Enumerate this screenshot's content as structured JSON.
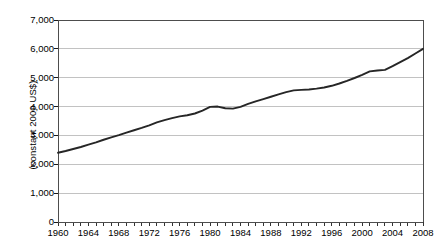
{
  "chart_data": {
    "type": "line",
    "title": "",
    "xlabel": "",
    "ylabel": "(constant 2000 US$)",
    "xlim": [
      1960,
      2008
    ],
    "ylim": [
      0,
      7000
    ],
    "grid": true,
    "legend": "none",
    "y_ticks": [
      0,
      1000,
      2000,
      3000,
      4000,
      5000,
      6000,
      7000
    ],
    "y_tick_labels": [
      "0",
      "1,000",
      "2,000",
      "3,000",
      "4,000",
      "5,000",
      "6,000",
      "7,000"
    ],
    "x_tick_labels": [
      "1960",
      "1964",
      "1968",
      "1972",
      "1976",
      "1980",
      "1984",
      "1988",
      "1992",
      "1996",
      "2000",
      "2004",
      "2008"
    ],
    "x_tick_interval_minor": 1,
    "x_tick_interval_major": 4,
    "series": [
      {
        "name": "GDP per capita",
        "color": "#262626",
        "x": [
          1960,
          1961,
          1962,
          1963,
          1964,
          1965,
          1966,
          1967,
          1968,
          1969,
          1970,
          1971,
          1972,
          1973,
          1974,
          1975,
          1976,
          1977,
          1978,
          1979,
          1980,
          1981,
          1982,
          1983,
          1984,
          1985,
          1986,
          1987,
          1988,
          1989,
          1990,
          1991,
          1992,
          1993,
          1994,
          1995,
          1996,
          1997,
          1998,
          1999,
          2000,
          2001,
          2002,
          2003,
          2004,
          2005,
          2006,
          2007,
          2008
        ],
        "values": [
          2400,
          2460,
          2530,
          2600,
          2680,
          2760,
          2850,
          2930,
          3010,
          3100,
          3180,
          3260,
          3350,
          3450,
          3530,
          3600,
          3660,
          3700,
          3760,
          3860,
          3990,
          4000,
          3940,
          3930,
          3990,
          4090,
          4180,
          4260,
          4340,
          4420,
          4500,
          4560,
          4580,
          4590,
          4620,
          4660,
          4720,
          4800,
          4890,
          4990,
          5100,
          5220,
          5250,
          5270,
          5400,
          5540,
          5680,
          5840,
          6000
        ]
      }
    ],
    "annotations": []
  },
  "axis": {
    "y_title": "(constant 2000 US$)"
  }
}
